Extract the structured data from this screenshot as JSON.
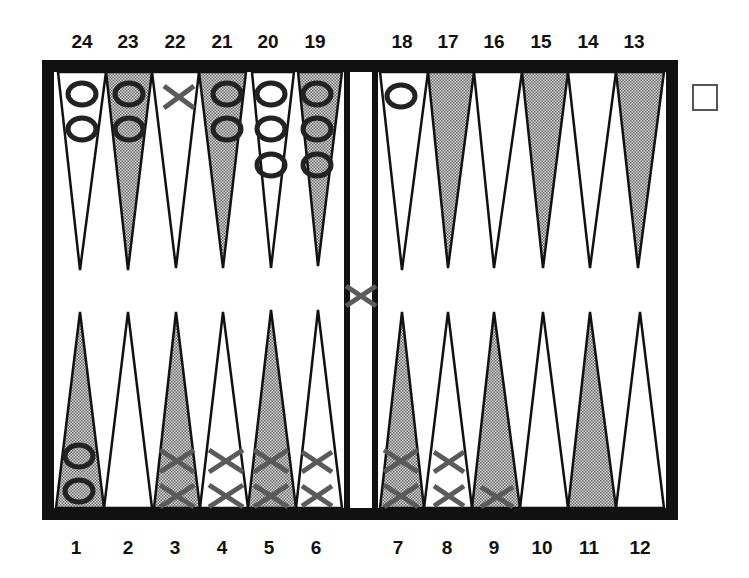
{
  "game": "backgammon",
  "labels": {
    "top": [
      "24",
      "23",
      "22",
      "21",
      "20",
      "19",
      "18",
      "17",
      "16",
      "15",
      "14",
      "13"
    ],
    "bottom": [
      "1",
      "2",
      "3",
      "4",
      "5",
      "6",
      "7",
      "8",
      "9",
      "10",
      "11",
      "12"
    ]
  },
  "colors": {
    "frame": "#111111",
    "shaded_point": "#b9b9b9",
    "light_point": "#ffffff",
    "o_checker": "#222222",
    "x_checker": "#5a5a5a",
    "cube_border": "#555555"
  },
  "points": [
    {
      "point": 1,
      "pieces": "O",
      "count": 2
    },
    {
      "point": 2,
      "pieces": "",
      "count": 0
    },
    {
      "point": 3,
      "pieces": "X",
      "count": 2
    },
    {
      "point": 4,
      "pieces": "X",
      "count": 2
    },
    {
      "point": 5,
      "pieces": "X",
      "count": 2
    },
    {
      "point": 6,
      "pieces": "X",
      "count": 2
    },
    {
      "point": 7,
      "pieces": "X",
      "count": 2
    },
    {
      "point": 8,
      "pieces": "X",
      "count": 2
    },
    {
      "point": 9,
      "pieces": "X",
      "count": 1
    },
    {
      "point": 10,
      "pieces": "",
      "count": 0
    },
    {
      "point": 11,
      "pieces": "",
      "count": 0
    },
    {
      "point": 12,
      "pieces": "",
      "count": 0
    },
    {
      "point": 13,
      "pieces": "",
      "count": 0
    },
    {
      "point": 14,
      "pieces": "",
      "count": 0
    },
    {
      "point": 15,
      "pieces": "",
      "count": 0
    },
    {
      "point": 16,
      "pieces": "",
      "count": 0
    },
    {
      "point": 17,
      "pieces": "",
      "count": 0
    },
    {
      "point": 18,
      "pieces": "O",
      "count": 1
    },
    {
      "point": 19,
      "pieces": "O",
      "count": 3
    },
    {
      "point": 20,
      "pieces": "O",
      "count": 3
    },
    {
      "point": 21,
      "pieces": "O",
      "count": 2
    },
    {
      "point": 22,
      "pieces": "X",
      "count": 1
    },
    {
      "point": 23,
      "pieces": "O",
      "count": 2
    },
    {
      "point": 24,
      "pieces": "O",
      "count": 2
    }
  ],
  "bar": {
    "pieces": "X",
    "count": 1
  },
  "doubling_cube": {
    "value": ""
  }
}
